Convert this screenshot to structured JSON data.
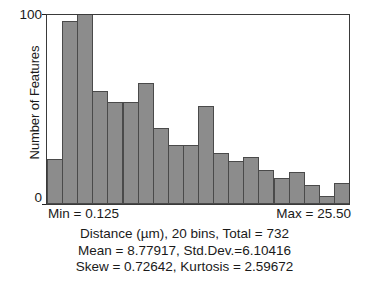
{
  "chart_data": {
    "type": "bar",
    "title": "",
    "subtitle": "",
    "xlabel": "Distance (µm)",
    "ylabel": "Number of Features",
    "ylim": [
      0,
      100
    ],
    "xlim": [
      0.125,
      25.5
    ],
    "grid": false,
    "legend": null,
    "bins": 20,
    "total": 732,
    "categories": [
      "1",
      "2",
      "3",
      "4",
      "5",
      "6",
      "7",
      "8",
      "9",
      "10",
      "11",
      "12",
      "13",
      "14",
      "15",
      "16",
      "17",
      "18",
      "19",
      "20"
    ],
    "values": [
      24,
      97,
      104,
      60,
      54,
      54,
      64,
      40,
      31,
      31,
      52,
      27,
      23,
      25,
      18,
      14,
      17,
      10,
      4,
      11
    ],
    "y_ticks": [
      "100",
      "0"
    ],
    "y_tick_values": [
      100,
      0
    ],
    "annotations": {
      "min": "Min = 0.125",
      "max": "Max = 25.50",
      "line1": "Distance (µm), 20 bins, Total = 732",
      "line2": "Mean = 8.77917, Std.Dev.=6.10416",
      "line3": "Skew = 0.72642, Kurtosis = 2.59672"
    },
    "stats": {
      "min": 0.125,
      "max": 25.5,
      "mean": 8.77917,
      "std_dev": 6.10416,
      "skew": 0.72642,
      "kurtosis": 2.59672
    },
    "colors": {
      "bar_fill": "#8c8c8c",
      "bar_stroke": "#4a4a4a",
      "axis": "#3a3a3a",
      "text": "#1a1a1a",
      "background": "#ffffff"
    }
  }
}
